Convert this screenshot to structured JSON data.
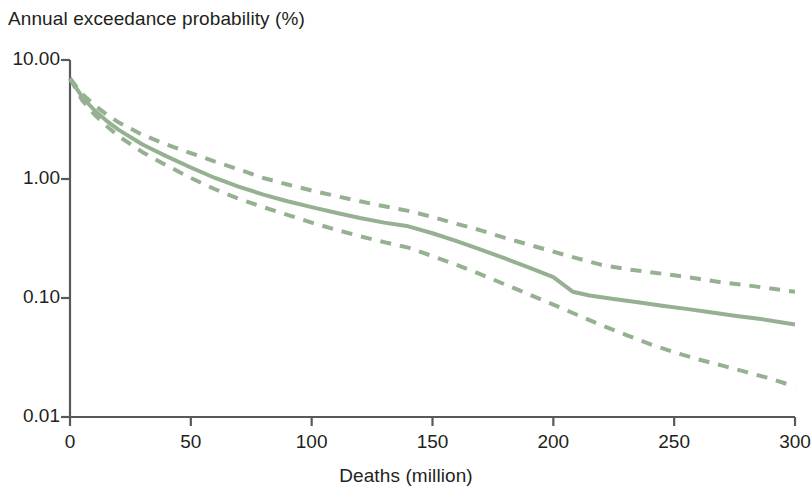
{
  "chart_data": {
    "type": "line",
    "title": "",
    "ylabel": "Annual exceedance probability (%)",
    "xlabel": "Deaths (million)",
    "y_scale": "log",
    "x_scale": "linear",
    "xlim": [
      0,
      300
    ],
    "ylim": [
      0.01,
      10.0
    ],
    "grid": false,
    "legend": "none",
    "y_ticks": [
      "10.00",
      "1.00",
      "0.10",
      "0.01"
    ],
    "y_tick_values": [
      10.0,
      1.0,
      0.1,
      0.01
    ],
    "x_ticks": [
      "0",
      "50",
      "100",
      "150",
      "200",
      "250",
      "300"
    ],
    "x_tick_values": [
      0,
      50,
      100,
      150,
      200,
      250,
      300
    ],
    "line_color": "#95b191",
    "series": [
      {
        "name": "upper bound",
        "style": "dashed",
        "x": [
          0,
          5,
          10,
          15,
          20,
          30,
          40,
          50,
          60,
          70,
          80,
          90,
          100,
          110,
          120,
          130,
          140,
          150,
          160,
          170,
          180,
          190,
          200,
          210,
          220,
          230,
          240,
          250,
          260,
          270,
          280,
          290,
          300
        ],
        "y": [
          7.0,
          5.2,
          4.2,
          3.5,
          3.0,
          2.35,
          1.95,
          1.65,
          1.4,
          1.2,
          1.02,
          0.9,
          0.8,
          0.72,
          0.65,
          0.59,
          0.54,
          0.48,
          0.42,
          0.37,
          0.32,
          0.28,
          0.245,
          0.215,
          0.19,
          0.175,
          0.165,
          0.155,
          0.145,
          0.135,
          0.128,
          0.12,
          0.113
        ]
      },
      {
        "name": "central estimate",
        "style": "solid",
        "x": [
          0,
          5,
          10,
          15,
          20,
          30,
          40,
          50,
          60,
          70,
          80,
          90,
          100,
          110,
          120,
          130,
          140,
          150,
          160,
          170,
          180,
          190,
          200,
          208,
          215,
          225,
          235,
          245,
          255,
          265,
          275,
          285,
          300
        ],
        "y": [
          7.0,
          4.9,
          3.8,
          3.1,
          2.6,
          1.95,
          1.55,
          1.25,
          1.02,
          0.86,
          0.74,
          0.65,
          0.58,
          0.52,
          0.47,
          0.43,
          0.4,
          0.35,
          0.3,
          0.255,
          0.215,
          0.18,
          0.15,
          0.113,
          0.105,
          0.098,
          0.092,
          0.086,
          0.081,
          0.076,
          0.071,
          0.067,
          0.06
        ]
      },
      {
        "name": "lower bound",
        "style": "dashed",
        "x": [
          0,
          5,
          10,
          15,
          20,
          30,
          40,
          50,
          60,
          70,
          80,
          90,
          100,
          110,
          120,
          130,
          140,
          150,
          160,
          170,
          180,
          190,
          200,
          210,
          220,
          230,
          240,
          250,
          260,
          270,
          280,
          290,
          300
        ],
        "y": [
          7.0,
          4.6,
          3.5,
          2.8,
          2.3,
          1.68,
          1.3,
          1.02,
          0.82,
          0.68,
          0.58,
          0.5,
          0.43,
          0.375,
          0.33,
          0.295,
          0.265,
          0.225,
          0.19,
          0.158,
          0.13,
          0.107,
          0.088,
          0.072,
          0.059,
          0.049,
          0.041,
          0.035,
          0.0305,
          0.027,
          0.0238,
          0.021,
          0.018
        ]
      }
    ]
  }
}
